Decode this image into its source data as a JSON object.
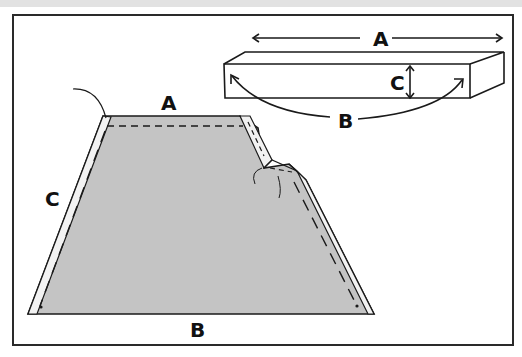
{
  "diagram": {
    "block": {
      "labels": {
        "length": "A",
        "perimeter_curve": "B",
        "height": "C"
      }
    },
    "panel": {
      "labels": {
        "top_edge": "A",
        "bottom_edge": "B",
        "side_edge": "C"
      }
    },
    "colors": {
      "fabric": "#c4c4c4",
      "ink": "#1a1a1a",
      "background": "#ffffff",
      "top_strip": "#e2e2e2"
    }
  }
}
